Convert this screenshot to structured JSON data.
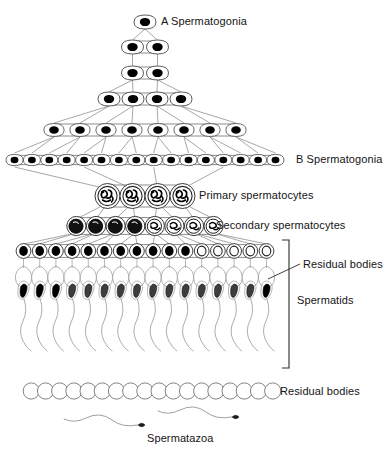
{
  "figure": {
    "background_color": "#ffffff",
    "ink_color": "#000000",
    "line_color": "#6e6e6e"
  },
  "labels": {
    "a_spermatogonia": "A Spermatogonia",
    "b_spermatogonia": "B Spermatogonia",
    "primary_spermatocytes": "Primary spermatocytes",
    "secondary_spermatocytes": "Secondary spermatocytes",
    "residual_bodies_upper": "Residual bodies",
    "spermatids": "Spermatids",
    "residual_bodies_lower": "Residual bodies",
    "spermatazoa": "Spermatazoa"
  },
  "chart_data": {
    "type": "diagram",
    "stages": [
      {
        "name": "A Spermatogonia",
        "row": 1,
        "cell_count": 1,
        "cell_style": "oval-with-black-nucleus",
        "y": 22
      },
      {
        "name": "A Spermatogonia",
        "row": 2,
        "cell_count": 2,
        "cell_style": "oval-with-black-nucleus",
        "y": 47
      },
      {
        "name": "A Spermatogonia",
        "row": 3,
        "cell_count": 2,
        "cell_style": "oval-with-black-nucleus",
        "y": 73
      },
      {
        "name": "A Spermatogonia",
        "row": 4,
        "cell_count": 4,
        "cell_style": "oval-with-black-nucleus",
        "y": 99
      },
      {
        "name": "A Spermatogonia",
        "row": 5,
        "cell_count": 8,
        "cell_style": "oval-with-black-nucleus",
        "y": 130
      },
      {
        "name": "B Spermatogonia",
        "row": 6,
        "cell_count": 16,
        "cell_style": "oval-with-black-nucleus",
        "y": 160
      },
      {
        "name": "Primary spermatocytes",
        "row": 7,
        "cell_count": 4,
        "cell_style": "round-with-chromosome-threads",
        "y": 196
      },
      {
        "name": "Secondary spermatocytes",
        "row": 8,
        "cell_count": 8,
        "cell_style": "round-with-dark-nucleus",
        "y": 226
      },
      {
        "name": "Spermatids (round)",
        "row": 9,
        "cell_count": 16,
        "cell_style": "small-round-with-nucleus",
        "y": 251
      },
      {
        "name": "Spermatids (elongating)",
        "row": 10,
        "cell_count": 16,
        "cell_style": "tailed-spermatid-with-residual-body",
        "y": 300
      },
      {
        "name": "Residual bodies",
        "row": 11,
        "cell_count": 18,
        "cell_style": "empty-circle-chain",
        "y": 391
      },
      {
        "name": "Spermatazoa",
        "row": 12,
        "cell_count": 2,
        "cell_style": "free-sperm",
        "y": 424
      }
    ],
    "branching": "Each row divides into the next: 1 → 2 → 2 → 4 → 8 → 16 cells joined by intercellular bridges; 16 B spermatogonia feed 4 primary spermatocytes, which divide to 8 secondary spermatocytes, then 16 spermatids.",
    "bracket": {
      "label": "Spermatids",
      "x": 288,
      "y_top": 240,
      "y_bottom": 368
    },
    "legend_position": "right"
  }
}
